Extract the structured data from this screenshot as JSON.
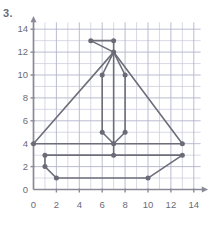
{
  "problem": {
    "number": "3."
  },
  "chart_data": {
    "type": "scatter",
    "title": "",
    "xlabel": "",
    "ylabel": "",
    "xlim": [
      0,
      14.6
    ],
    "ylim": [
      0,
      14.6
    ],
    "grid": true,
    "grid_step": 1,
    "legend": "none",
    "xticks": [
      0,
      2,
      4,
      6,
      8,
      10,
      12,
      14
    ],
    "yticks": [
      0,
      2,
      4,
      6,
      8,
      10,
      12,
      14
    ],
    "xtick_labels": [
      "0",
      "2",
      "4",
      "6",
      "8",
      "10",
      "12",
      "14"
    ],
    "ytick_labels": [
      "0",
      "2",
      "4",
      "6",
      "8",
      "10",
      "12",
      "14"
    ],
    "points": [
      {
        "x": 5,
        "y": 13
      },
      {
        "x": 7,
        "y": 13
      },
      {
        "x": 7,
        "y": 12
      },
      {
        "x": 6,
        "y": 10
      },
      {
        "x": 8,
        "y": 10
      },
      {
        "x": 6,
        "y": 5
      },
      {
        "x": 8,
        "y": 5
      },
      {
        "x": 7,
        "y": 4
      },
      {
        "x": 7,
        "y": 3
      },
      {
        "x": 0,
        "y": 4
      },
      {
        "x": 13,
        "y": 4
      },
      {
        "x": 1,
        "y": 3
      },
      {
        "x": 13,
        "y": 3
      },
      {
        "x": 1,
        "y": 2
      },
      {
        "x": 2,
        "y": 1
      },
      {
        "x": 10,
        "y": 1
      }
    ],
    "segments": [
      {
        "name": "flag-top",
        "from": [
          5,
          13
        ],
        "to": [
          7,
          13
        ]
      },
      {
        "name": "flag-diagonal",
        "from": [
          5,
          13
        ],
        "to": [
          7,
          12
        ]
      },
      {
        "name": "flag-right",
        "from": [
          7,
          13
        ],
        "to": [
          7,
          12
        ]
      },
      {
        "name": "sail-left-edge",
        "from": [
          7,
          12
        ],
        "to": [
          0,
          4
        ]
      },
      {
        "name": "sail-right-edge",
        "from": [
          7,
          12
        ],
        "to": [
          13,
          4
        ]
      },
      {
        "name": "mast",
        "from": [
          7,
          12
        ],
        "to": [
          7,
          3
        ]
      },
      {
        "name": "inner-left-top",
        "from": [
          7,
          12
        ],
        "to": [
          6,
          10
        ]
      },
      {
        "name": "inner-right-top",
        "from": [
          7,
          12
        ],
        "to": [
          8,
          10
        ]
      },
      {
        "name": "inner-left-side",
        "from": [
          6,
          10
        ],
        "to": [
          6,
          5
        ]
      },
      {
        "name": "inner-right-side",
        "from": [
          8,
          10
        ],
        "to": [
          8,
          5
        ]
      },
      {
        "name": "inner-left-base",
        "from": [
          6,
          5
        ],
        "to": [
          7,
          4
        ]
      },
      {
        "name": "inner-right-base",
        "from": [
          8,
          5
        ],
        "to": [
          7,
          4
        ]
      },
      {
        "name": "deck-line",
        "from": [
          0,
          4
        ],
        "to": [
          13,
          4
        ]
      },
      {
        "name": "gunwale-line",
        "from": [
          1,
          3
        ],
        "to": [
          13,
          3
        ]
      },
      {
        "name": "bow-upper",
        "from": [
          1,
          3
        ],
        "to": [
          1,
          2
        ]
      },
      {
        "name": "bow-lower",
        "from": [
          1,
          2
        ],
        "to": [
          2,
          1
        ]
      },
      {
        "name": "keel-line",
        "from": [
          2,
          1
        ],
        "to": [
          10,
          1
        ]
      },
      {
        "name": "stern-slope",
        "from": [
          10,
          1
        ],
        "to": [
          13,
          3
        ]
      }
    ],
    "colors": {
      "line": "#6e6e7a",
      "point": "#6b6b78",
      "axis": "#8a8a96",
      "grid": "#c9c9dd",
      "grid_major": "#b4b4cc",
      "text": "#6b6b78",
      "background": "#ffffff"
    }
  }
}
